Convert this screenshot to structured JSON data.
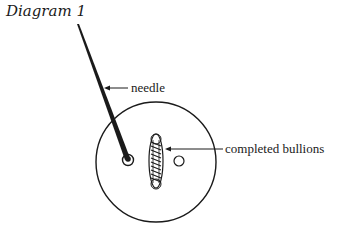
{
  "diagram": {
    "title": "Diagram 1",
    "labels": {
      "needle": "needle",
      "bullions": "completed bullions"
    },
    "colors": {
      "ink": "#1a1a1a",
      "background": "#ffffff"
    }
  }
}
